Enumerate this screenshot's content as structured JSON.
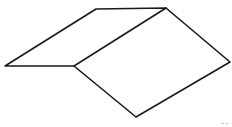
{
  "diagram": {
    "type": "line-drawing",
    "stroke_color": "#1a1a1a",
    "background": "#ffffff",
    "vertices": {
      "ridge_left": [
        96,
        9
      ],
      "ridge_right": [
        166,
        8
      ],
      "eave_left": [
        5,
        66
      ],
      "fold_bottom": [
        74,
        66
      ],
      "right_corner": [
        230,
        62
      ],
      "bottom_corner": [
        136,
        117
      ]
    },
    "edges": [
      [
        "ridge_left",
        "ridge_right"
      ],
      [
        "ridge_left",
        "eave_left"
      ],
      [
        "eave_left",
        "fold_bottom"
      ],
      [
        "fold_bottom",
        "ridge_right"
      ],
      [
        "ridge_right",
        "right_corner"
      ],
      [
        "right_corner",
        "bottom_corner"
      ],
      [
        "bottom_corner",
        "fold_bottom"
      ]
    ],
    "faces": [
      {
        "name": "left-face",
        "points": [
          "ridge_left",
          "ridge_right",
          "fold_bottom",
          "eave_left"
        ]
      },
      {
        "name": "right-face",
        "points": [
          "ridge_right",
          "right_corner",
          "bottom_corner",
          "fold_bottom"
        ]
      }
    ]
  }
}
